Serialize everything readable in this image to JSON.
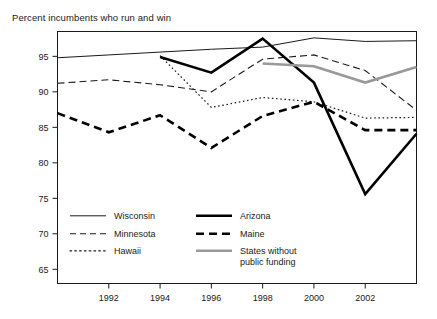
{
  "chart_data": {
    "type": "line",
    "title": "Percent incumbents who run and win",
    "xlabel": "",
    "ylabel": "",
    "xlim": [
      1990,
      2004
    ],
    "ylim": [
      63,
      98.5
    ],
    "grid": false,
    "legend_position": "inside-bottom-left",
    "x_ticks": [
      "1992",
      "1994",
      "1996",
      "1998",
      "2000",
      "2002"
    ],
    "x_tick_values": [
      1992,
      1994,
      1996,
      1998,
      2000,
      2002
    ],
    "y_ticks": [
      "65",
      "70",
      "75",
      "80",
      "85",
      "90",
      "95"
    ],
    "y_tick_values": [
      65,
      70,
      75,
      80,
      85,
      90,
      95
    ],
    "series": [
      {
        "name": "Wisconsin",
        "style": "thin-solid",
        "color": "#1a1a1a",
        "width": 1,
        "x": [
          1990,
          1992,
          1994,
          1996,
          1998,
          2000,
          2002,
          2004
        ],
        "values": [
          94.8,
          95.2,
          95.6,
          96.0,
          96.3,
          97.6,
          97.1,
          97.2
        ]
      },
      {
        "name": "Minnesota",
        "style": "dashed",
        "color": "#1a1a1a",
        "width": 1.1,
        "x": [
          1990,
          1992,
          1994,
          1996,
          1998,
          2000,
          2002,
          2004
        ],
        "values": [
          91.2,
          91.7,
          91.0,
          90.0,
          94.6,
          95.2,
          93.0,
          87.4
        ]
      },
      {
        "name": "Hawaii",
        "style": "dotted",
        "color": "#1a1a1a",
        "width": 1.2,
        "x": [
          1994,
          1996,
          1998,
          2000,
          2002,
          2004
        ],
        "values": [
          95.1,
          87.8,
          89.2,
          88.6,
          86.3,
          86.4
        ]
      },
      {
        "name": "Arizona",
        "style": "thick-solid",
        "color": "#000000",
        "width": 2.6,
        "x": [
          1994,
          1996,
          1998,
          2000,
          2002,
          2004
        ],
        "values": [
          94.9,
          92.7,
          97.5,
          91.3,
          75.6,
          84.1
        ]
      },
      {
        "name": "Maine",
        "style": "thick-dashed",
        "color": "#000000",
        "width": 2.6,
        "x": [
          1990,
          1992,
          1994,
          1996,
          1998,
          2000,
          2002,
          2004
        ],
        "values": [
          87.0,
          84.3,
          86.7,
          82.1,
          86.6,
          88.6,
          84.6,
          84.6
        ]
      },
      {
        "name": "States without public funding",
        "style": "thick-gray-solid",
        "color": "#999999",
        "width": 2.6,
        "x": [
          1998,
          2000,
          2002,
          2004
        ],
        "values": [
          94.0,
          93.6,
          91.3,
          93.5
        ]
      }
    ],
    "legend": [
      {
        "label": "Wisconsin",
        "style": "thin-solid",
        "color": "#1a1a1a"
      },
      {
        "label": "Minnesota",
        "style": "dashed",
        "color": "#1a1a1a"
      },
      {
        "label": "Hawaii",
        "style": "dotted",
        "color": "#1a1a1a"
      },
      {
        "label": "Arizona",
        "style": "thick-solid",
        "color": "#000000"
      },
      {
        "label": "Maine",
        "style": "thick-dashed",
        "color": "#000000"
      },
      {
        "label": "States without",
        "label2": "public funding",
        "style": "thick-gray-solid",
        "color": "#999999"
      }
    ]
  }
}
